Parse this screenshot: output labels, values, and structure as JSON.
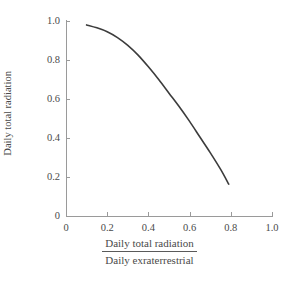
{
  "chart_data": {
    "type": "line",
    "title": "",
    "subtitle": "",
    "xlabel_numerator": "Daily total radiation",
    "xlabel_denominator": "Daily exraterrestrial",
    "ylabel_numerator": "Daily total diffuse",
    "ylabel_denominator": "Daily total radiation",
    "xlim": [
      0,
      1.0
    ],
    "ylim": [
      0,
      1.0
    ],
    "grid": false,
    "legend": "none",
    "xticks": [
      "0",
      "0.2",
      "0.4",
      "0.6",
      "0.8",
      "1.0"
    ],
    "xtick_values": [
      0,
      0.2,
      0.4,
      0.6,
      0.8,
      1.0
    ],
    "yticks": [
      "0",
      "0.2",
      "0.4",
      "0.6",
      "0.8",
      "1.0"
    ],
    "ytick_values": [
      0,
      0.2,
      0.4,
      0.6,
      0.8,
      1.0
    ],
    "series": [
      {
        "name": "diffuse-fraction-curve",
        "color": "#3c3c3c",
        "line_width": 1.6,
        "x": [
          0.1,
          0.15,
          0.2,
          0.25,
          0.3,
          0.35,
          0.4,
          0.45,
          0.5,
          0.55,
          0.6,
          0.65,
          0.7,
          0.75,
          0.79
        ],
        "y": [
          0.98,
          0.965,
          0.945,
          0.915,
          0.875,
          0.825,
          0.765,
          0.7,
          0.63,
          0.56,
          0.485,
          0.405,
          0.325,
          0.24,
          0.163
        ]
      }
    ],
    "annotations": [],
    "axis_color": "#9a9a9a",
    "text_color": "#4a4a4a",
    "background": "#ffffff"
  },
  "layout": {
    "plot_left_px": 66,
    "plot_right_px": 272,
    "plot_top_px": 21,
    "plot_bottom_px": 216
  }
}
